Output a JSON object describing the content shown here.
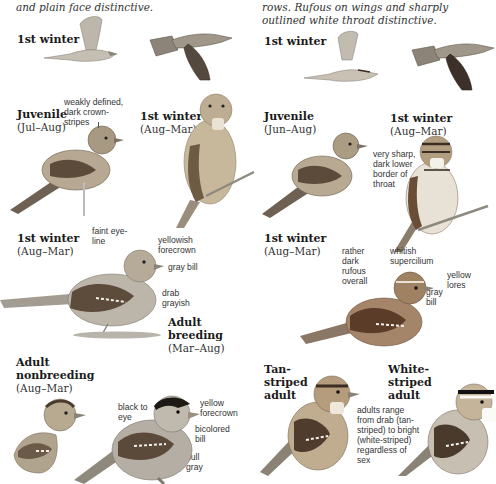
{
  "left_column": {
    "intro_text": "and plain face distinctive.",
    "flight": {
      "title": "1st winter"
    },
    "juvenile": {
      "title": "Juvenile",
      "range": "(Jul–Aug)",
      "note": "weakly defined, dark crown-stripes"
    },
    "first_winter_front": {
      "title": "1st winter",
      "range": "(Aug–Mar)"
    },
    "first_winter_side": {
      "title": "1st winter",
      "range": "(Aug–Mar)",
      "notes": {
        "eye_line": "faint eye-line",
        "forecrown": "yellowish forecrown",
        "bill": "gray bill",
        "body": "drab grayish"
      }
    },
    "adult_breeding": {
      "title_1": "Adult",
      "title_2": "breeding",
      "range": "(Mar–Aug)",
      "notes": {
        "eye": "black to eye",
        "forecrown": "yellow forecrown",
        "bill": "bicolored bill",
        "body": "dull gray"
      }
    },
    "adult_nonbreeding": {
      "title_1": "Adult",
      "title_2": "nonbreeding",
      "range": "(Aug–Mar)"
    }
  },
  "right_column": {
    "intro_text": "rows. Rufous on wings and sharply outlined white throat distinctive.",
    "flight": {
      "title": "1st winter"
    },
    "juvenile": {
      "title": "Juvenile",
      "range": "(Jun–Aug)"
    },
    "first_winter_front": {
      "title": "1st winter",
      "range": "(Aug–Mar)",
      "note": "very sharp, dark lower border of throat"
    },
    "first_winter_side": {
      "title": "1st winter",
      "range": "(Aug–Mar)",
      "notes": {
        "rufous": "rather dark rufous overall",
        "supercilium": "whitish supercilium",
        "lores": "yellow lores",
        "bill": "gray bill"
      }
    },
    "tan_striped": {
      "title_1": "Tan-",
      "title_2": "striped",
      "title_3": "adult"
    },
    "white_striped": {
      "title_1": "White-",
      "title_2": "striped",
      "title_3": "adult",
      "note": "adults range from drab (tan-striped) to bright (white-striped) regardless of sex"
    }
  },
  "colors": {
    "text": "#222222",
    "bird_gray": "#a9a49b",
    "bird_brown": "#7a5a3c",
    "bird_dark": "#3b2d22",
    "rufous": "#8a5a35"
  }
}
